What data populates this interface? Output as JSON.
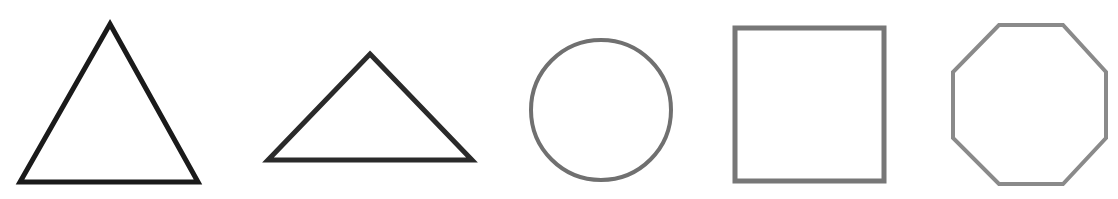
{
  "canvas": {
    "width": 1118,
    "height": 199,
    "background": "#ffffff"
  },
  "shapes": [
    {
      "name": "equilateral-triangle",
      "type": "polygon",
      "points": "110,24 198,182 20,182",
      "stroke": "#1a1a1a",
      "stroke_width": 5,
      "fill": "none"
    },
    {
      "name": "obtuse-triangle",
      "type": "polygon",
      "points": "370,54 472,160 268,160",
      "stroke": "#2a2a2a",
      "stroke_width": 5,
      "fill": "none"
    },
    {
      "name": "circle",
      "type": "circle",
      "cx": 601,
      "cy": 110,
      "r": 70,
      "stroke": "#707070",
      "stroke_width": 4,
      "fill": "none"
    },
    {
      "name": "square",
      "type": "rect",
      "x": 735,
      "y": 28,
      "width": 149,
      "height": 153,
      "stroke": "#777777",
      "stroke_width": 5,
      "fill": "none"
    },
    {
      "name": "octagon",
      "type": "polygon",
      "points": "999,25 1063,25 1106,72 1106,138 1063,184 999,184 953,138 953,72",
      "stroke": "#8a8a8a",
      "stroke_width": 4,
      "fill": "none"
    }
  ]
}
